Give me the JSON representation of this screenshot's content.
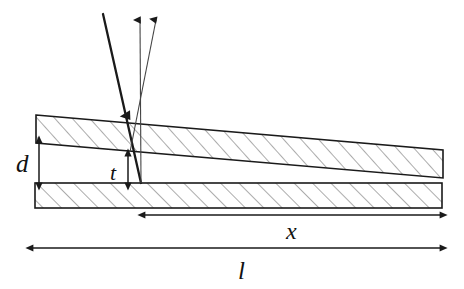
{
  "figure": {
    "background_color": "#ffffff",
    "ink_color": "#111111",
    "hatch_color": "#555555",
    "width": 464,
    "height": 289
  },
  "labels": {
    "gap_thickness": "d",
    "local_thickness": "t",
    "distance_x": "x",
    "total_length": "l"
  },
  "dimension_arrows": [
    {
      "name": "d",
      "label": "d",
      "orientation": "vertical",
      "double_headed": true,
      "from": [
        39,
        143
      ],
      "to": [
        39,
        183
      ]
    },
    {
      "name": "t",
      "label": "t",
      "orientation": "vertical",
      "double_headed": true,
      "from": [
        128,
        156
      ],
      "to": [
        128,
        183
      ]
    },
    {
      "name": "x",
      "label": "x",
      "orientation": "horizontal",
      "double_headed": true,
      "from": [
        145,
        215
      ],
      "to": [
        440,
        215
      ]
    },
    {
      "name": "l",
      "label": "l",
      "orientation": "horizontal",
      "double_headed": true,
      "from": [
        33,
        248
      ],
      "to": [
        440,
        248
      ]
    }
  ],
  "plates": [
    {
      "name": "upper-wedge-plate",
      "hatched": true,
      "points": "36,115 443,150 443,178 36,143"
    },
    {
      "name": "lower-flat-plate",
      "hatched": true,
      "points": "35,183 442,183 442,208 35,208"
    }
  ],
  "rays": [
    {
      "name": "incident-ray",
      "kind": "incident",
      "weight": "thick",
      "from": [
        103,
        14
      ],
      "to": [
        141,
        183
      ],
      "arrow_at": [
        123,
        90
      ],
      "arrow_direction": "down"
    },
    {
      "name": "reflected-ray-1",
      "kind": "reflected",
      "weight": "thin",
      "from": [
        141,
        183
      ],
      "to": [
        140,
        18
      ],
      "arrow_direction": "up"
    },
    {
      "name": "reflected-ray-2",
      "kind": "reflected",
      "weight": "thin",
      "from": [
        131,
        150
      ],
      "to": [
        156,
        18
      ],
      "arrow_direction": "up"
    }
  ]
}
